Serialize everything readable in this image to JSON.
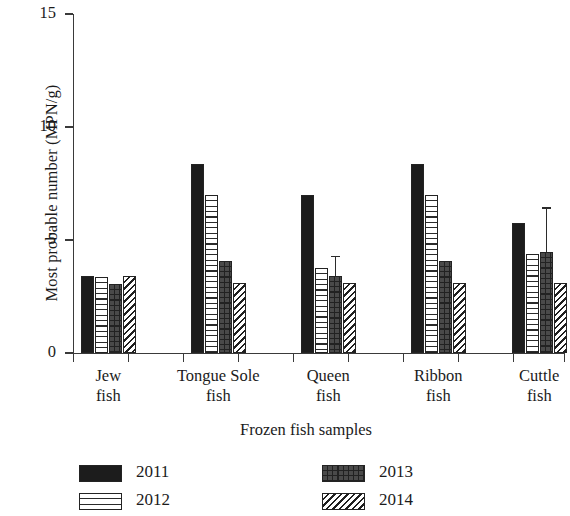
{
  "chart_data": {
    "type": "bar",
    "title": "",
    "xlabel": "Frozen fish samples",
    "ylabel": "Most probable number (MPN/g)",
    "categories": [
      "Jew fish",
      "Tongue Sole fish",
      "Queen fish",
      "Ribbon fish",
      "Cuttle fish"
    ],
    "category_lines": [
      [
        "Jew",
        "fish"
      ],
      [
        "Tongue Sole",
        "fish"
      ],
      [
        "Queen",
        "fish"
      ],
      [
        "Ribbon",
        "fish"
      ],
      [
        "Cuttle",
        "fish"
      ]
    ],
    "ylim": [
      0,
      15
    ],
    "yticks": [
      0,
      5,
      10,
      15
    ],
    "ytick_labels": [
      "0",
      "5",
      "10",
      "15"
    ],
    "grid": false,
    "legend_position": "bottom",
    "series": [
      {
        "name": "2011",
        "pattern": "solid-black",
        "color": "#1c1c1c",
        "values": [
          3.4,
          8.35,
          7.0,
          8.35,
          5.75
        ],
        "errors": [
          null,
          null,
          null,
          null,
          null
        ]
      },
      {
        "name": "2012",
        "pattern": "horizontal-lines",
        "color": "#ffffff",
        "values": [
          3.35,
          7.0,
          3.75,
          7.0,
          4.4
        ],
        "errors": [
          null,
          null,
          null,
          null,
          null
        ]
      },
      {
        "name": "2013",
        "pattern": "brick-crosshatch",
        "color": "#4a4a4a",
        "values": [
          3.05,
          4.05,
          3.4,
          4.05,
          4.45
        ],
        "errors": [
          null,
          null,
          0.9,
          null,
          2.0
        ]
      },
      {
        "name": "2014",
        "pattern": "diagonal-hatch",
        "color": "#ffffff",
        "values": [
          3.4,
          3.1,
          3.1,
          3.1,
          3.1
        ],
        "errors": [
          null,
          null,
          null,
          null,
          null
        ]
      }
    ]
  },
  "axis": {
    "ylabel": "Most probable number (MPN/g)",
    "xlabel": "Frozen fish samples",
    "ytick_0": "0",
    "ytick_5": "5",
    "ytick_10": "10",
    "ytick_15": "15"
  },
  "legend": {
    "items": [
      {
        "label": "2011",
        "pattern": "solid-black"
      },
      {
        "label": "2012",
        "pattern": "horizontal-lines"
      },
      {
        "label": "2013",
        "pattern": "brick-crosshatch"
      },
      {
        "label": "2014",
        "pattern": "diagonal-hatch"
      }
    ]
  }
}
